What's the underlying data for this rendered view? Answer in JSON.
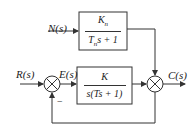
{
  "diagram": {
    "type": "control-block-diagram",
    "signals": {
      "input": "R(s)",
      "error": "E(s)",
      "disturbance": "N(s)",
      "output": "C(s)"
    },
    "blocks": {
      "disturbance_block": {
        "numerator": "Kn",
        "numerator_sub": "n",
        "denominator": "Tns + 1"
      },
      "plant_block": {
        "numerator": "K",
        "denominator": "s(Ts + 1)"
      }
    },
    "junctions": {
      "input_sum": {
        "feedback_sign": "−"
      },
      "output_sum": {}
    },
    "colors": {
      "line": "#333333",
      "background": "#ffffff"
    }
  }
}
